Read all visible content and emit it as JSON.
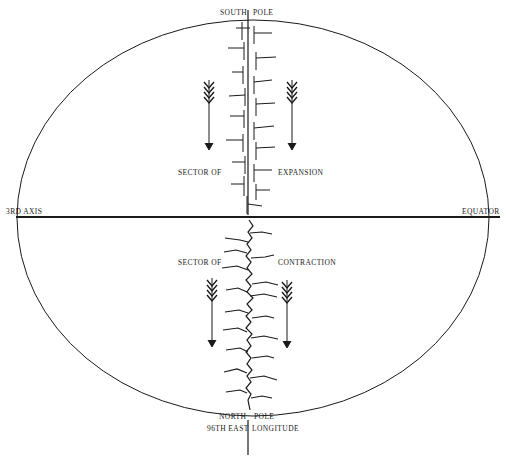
{
  "labels": {
    "south_pole_left": "SOUTH",
    "south_pole_right": "POLE",
    "axis_left": "3RD AXIS",
    "equator": "EQUATOR",
    "upper_left": "SECTOR OF",
    "upper_right": "EXPANSION",
    "lower_left": "SECTOR OF",
    "lower_right": "CONTRACTION",
    "north_pole_left": "NORTH",
    "north_pole_right": "POLE",
    "longitude_left": "96TH EAST",
    "longitude_right": "LONGITUDE"
  },
  "colors": {
    "ink": "#1a1a1a",
    "background": "#ffffff"
  }
}
